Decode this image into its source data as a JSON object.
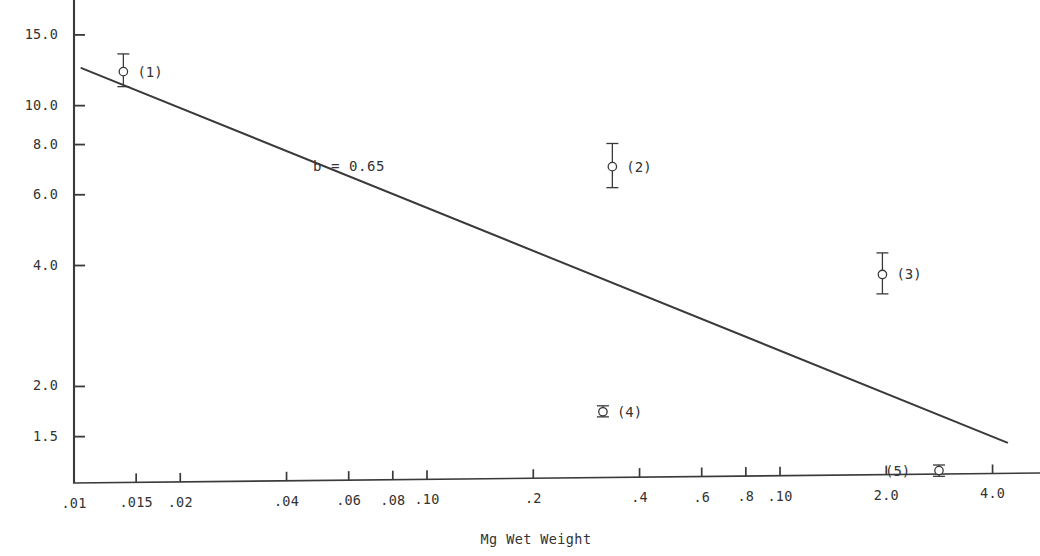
{
  "chart_data": {
    "type": "scatter",
    "title": "",
    "subtitle": "",
    "xlabel": "Mg Wet Weight",
    "ylabel": "",
    "xscale": "log",
    "yscale": "log",
    "grid": false,
    "legend": "none",
    "xlim": [
      0.01,
      4.6
    ],
    "ylim": [
      1.15,
      17.5
    ],
    "xticks": [
      {
        "value": 0.01,
        "label": ".01"
      },
      {
        "value": 0.015,
        "label": ".015"
      },
      {
        "value": 0.02,
        "label": ".02"
      },
      {
        "value": 0.04,
        "label": ".04"
      },
      {
        "value": 0.06,
        "label": ".06"
      },
      {
        "value": 0.08,
        "label": ".08"
      },
      {
        "value": 0.1,
        "label": ".10"
      },
      {
        "value": 0.2,
        "label": ".2"
      },
      {
        "value": 0.4,
        "label": ".4"
      },
      {
        "value": 0.6,
        "label": ".6"
      },
      {
        "value": 0.8,
        "label": ".8"
      },
      {
        "value": 1.0,
        "label": ".10"
      },
      {
        "value": 2.0,
        "label": "2.0"
      },
      {
        "value": 4.0,
        "label": "4.0"
      }
    ],
    "yticks": [
      {
        "value": 15.0,
        "label": "15.0"
      },
      {
        "value": 10.0,
        "label": "10.0"
      },
      {
        "value": 8.0,
        "label": "8.0"
      },
      {
        "value": 6.0,
        "label": "6.0"
      },
      {
        "value": 4.0,
        "label": "4.0"
      },
      {
        "value": 2.0,
        "label": "2.0"
      },
      {
        "value": 1.5,
        "label": "1.5"
      }
    ],
    "fit_line": {
      "label": "b = 0.65",
      "slope_exponent": 0.65,
      "x_start": 0.0105,
      "y_start": 12.4,
      "x_end": 4.4,
      "y_end": 1.45
    },
    "annotations": [
      {
        "name": "slope-annotation",
        "text": "b = 0.65",
        "x": 0.0475,
        "y": 7.35
      }
    ],
    "points": [
      {
        "label": "(1)",
        "x": 0.0138,
        "y": 12.15,
        "y_low": 11.15,
        "y_high": 13.45,
        "label_side": "right"
      },
      {
        "label": "(2)",
        "x": 0.335,
        "y": 7.05,
        "y_low": 6.25,
        "y_high": 8.05,
        "label_side": "right"
      },
      {
        "label": "(3)",
        "x": 1.95,
        "y": 3.8,
        "y_low": 3.4,
        "y_high": 4.3,
        "label_side": "right"
      },
      {
        "label": "(4)",
        "x": 0.315,
        "y": 1.73,
        "y_low": 1.68,
        "y_high": 1.79,
        "label_side": "right"
      },
      {
        "label": "(5)",
        "x": 2.82,
        "y": 1.235,
        "y_low": 1.195,
        "y_high": 1.275,
        "label_side": "left"
      }
    ]
  },
  "axes": {
    "x_axis_name": "x-axis",
    "y_axis_name": "y-axis"
  }
}
